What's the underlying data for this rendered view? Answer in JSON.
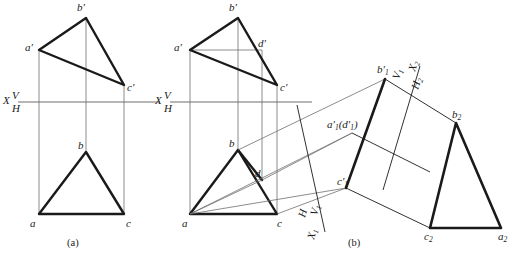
{
  "figure": {
    "background_color": "#ffffff",
    "ink_color": "#1a1a1a",
    "thin_line_color": "#6f6f6f",
    "captions": [
      {
        "id": "caption-a",
        "text": "(a)",
        "x": 74,
        "y": 243
      },
      {
        "id": "caption-b",
        "text": "(b)",
        "x": 355,
        "y": 243
      }
    ]
  },
  "view_a": {
    "name": "two-view-orthographic-projection",
    "ground_line": {
      "label_x": "X",
      "label_v": "V",
      "label_h": "H",
      "x1": 18,
      "x2": 160,
      "y": 102
    },
    "vertical_points": {
      "b_prime": {
        "label": "b'",
        "x": 81,
        "y": 10
      },
      "a_prime": {
        "label": "a'",
        "x": 30,
        "y": 47
      },
      "c_prime": {
        "label": "c'",
        "x": 129,
        "y": 81
      }
    },
    "horizontal_points": {
      "b": {
        "label": "b",
        "x": 81,
        "y": 150
      },
      "a": {
        "label": "a",
        "x": 34,
        "y": 214
      },
      "c": {
        "label": "c",
        "x": 119,
        "y": 214
      }
    }
  },
  "view_b_front": {
    "name": "two-view-with-auxiliary-point-d",
    "ground_line": {
      "label_x": "X",
      "label_v": "V",
      "label_h": "H",
      "x1": 170,
      "x2": 312,
      "y": 102
    },
    "vertical_points": {
      "b_prime": {
        "label": "b'",
        "x": 233,
        "y": 10
      },
      "a_prime": {
        "label": "a'",
        "x": 178,
        "y": 47
      },
      "c_prime": {
        "label": "c'",
        "x": 281,
        "y": 81
      },
      "d_prime": {
        "label": "d'",
        "x": 262,
        "y": 47
      }
    },
    "horizontal_points": {
      "b": {
        "label": "b",
        "x": 207,
        "y": 145
      },
      "a": {
        "label": "a",
        "x": 186,
        "y": 214
      },
      "c": {
        "label": "c",
        "x": 270,
        "y": 214
      },
      "d": {
        "label": "d",
        "x": 256,
        "y": 173
      }
    }
  },
  "view_b_auxiliary": {
    "name": "first-auxiliary-edge-view",
    "axis_lower_left": {
      "labels": [
        "H",
        "V",
        "1",
        "X",
        "1"
      ],
      "label_h": "H",
      "label_v1": "V₁",
      "label_x1": "X₁"
    },
    "axis_upper_right": {
      "label_v1": "V₁",
      "label_x2": "X₂",
      "label_h2": "H₂"
    },
    "points": {
      "b1_prime": {
        "label": "b'₁",
        "x": 385,
        "y": 79
      },
      "a1_d1_prime": {
        "label": "a'₁(d'₁)",
        "x": 338,
        "y": 129
      },
      "c1_prime": {
        "label": "c'₁",
        "x": 338,
        "y": 184
      }
    }
  },
  "view_b_true_shape": {
    "name": "second-auxiliary-true-shape-triangle",
    "points": {
      "b2": {
        "label": "b₂",
        "x": 456,
        "y": 123
      },
      "c2": {
        "label": "c₂",
        "x": 430,
        "y": 228
      },
      "a2": {
        "label": "a₂",
        "x": 501,
        "y": 228
      }
    }
  },
  "legend": {
    "thick_stroke_px": 2.4,
    "thin_stroke_px": 0.8
  }
}
